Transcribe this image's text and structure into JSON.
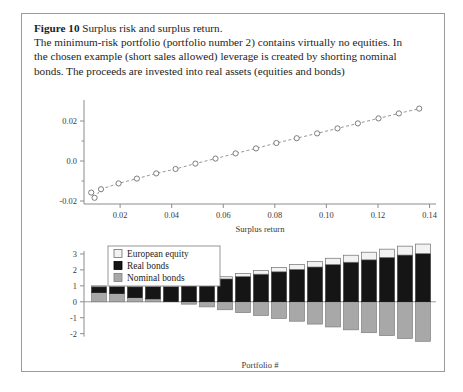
{
  "caption": {
    "figure_label": "Figure 10",
    "title": "Surplus risk and surplus return.",
    "line1": "The minimum-risk portfolio (portfolio number 2) contains virtually no equities. In",
    "line2": "the chosen example (short sales allowed) leverage is created by shorting nominal",
    "line3": "bonds. The proceeds are invested into real assets (equities and bonds)"
  },
  "colors": {
    "frame": "#9a9a9a",
    "axis": "#8c8c8c",
    "text": "#1d1d1d",
    "tick_text": "#3a3a3a",
    "european_equity": "#f2f2f2",
    "real_bonds": "#151515",
    "nominal_bonds": "#a8a8a8",
    "marker_stroke": "#6f6f6f",
    "line": "#8a8a8a"
  },
  "chart_data": [
    {
      "type": "scatter",
      "id": "surplus-frontier",
      "title": "",
      "xlabel": "Surplus return",
      "ylabel": "",
      "xlim": [
        0.006,
        0.1425
      ],
      "ylim": [
        -0.0215,
        0.0285
      ],
      "xticks": [
        0.02,
        0.04,
        0.06,
        0.08,
        0.1,
        0.12,
        0.14
      ],
      "xtick_labels": [
        "0.02",
        "0.04",
        "0.06",
        "0.08",
        "0.10",
        "0.12",
        "0.14"
      ],
      "yticks": [
        -0.02,
        0.0,
        0.02
      ],
      "ytick_labels": [
        "-0.02",
        "0.0",
        "0.02"
      ],
      "grid": false,
      "legend": "none",
      "marker": "open-circle",
      "connected": true,
      "x": [
        0.0088,
        0.0101,
        0.0126,
        0.0194,
        0.0265,
        0.034,
        0.0415,
        0.0492,
        0.057,
        0.0648,
        0.0727,
        0.0806,
        0.0885,
        0.0964,
        0.1043,
        0.1122,
        0.1202,
        0.1281,
        0.136
      ],
      "y": [
        -0.0158,
        -0.0184,
        -0.0141,
        -0.0112,
        -0.0088,
        -0.0062,
        -0.004,
        -0.0013,
        0.0012,
        0.0038,
        0.0063,
        0.009,
        0.0114,
        0.0138,
        0.0163,
        0.0188,
        0.0213,
        0.0238,
        0.0262
      ]
    },
    {
      "type": "bar",
      "id": "portfolio-weights",
      "stacked": true,
      "title": "",
      "xlabel": "Portfolio #",
      "ylabel": "",
      "ylim": [
        -2.65,
        3.75
      ],
      "yticks": [
        -2,
        -1,
        0,
        1,
        2,
        3
      ],
      "ytick_labels": [
        "-2",
        "-1",
        "0",
        "1",
        "2",
        "3"
      ],
      "grid": false,
      "legend": "upper-left",
      "categories": [
        "1",
        "2",
        "3",
        "4",
        "5",
        "6",
        "7",
        "8",
        "9",
        "10",
        "11",
        "12",
        "13",
        "14",
        "15",
        "16",
        "17",
        "18",
        "19"
      ],
      "series": [
        {
          "name": "Nominal bonds",
          "color": "#a8a8a8",
          "values": [
            0.58,
            0.52,
            0.26,
            0.18,
            0.02,
            -0.15,
            -0.32,
            -0.5,
            -0.68,
            -0.86,
            -1.04,
            -1.22,
            -1.4,
            -1.58,
            -1.76,
            -1.94,
            -2.12,
            -2.3,
            -2.48
          ]
        },
        {
          "name": "Real bonds",
          "color": "#151515",
          "values": [
            0.36,
            0.44,
            0.68,
            0.78,
            0.93,
            1.12,
            1.27,
            1.43,
            1.58,
            1.73,
            1.88,
            2.03,
            2.18,
            2.33,
            2.48,
            2.63,
            2.78,
            2.93,
            3.02
          ]
        },
        {
          "name": "European equity",
          "color": "#f2f2f2",
          "values": [
            0.06,
            0.04,
            0.06,
            0.04,
            0.05,
            0.07,
            0.1,
            0.14,
            0.19,
            0.23,
            0.27,
            0.31,
            0.35,
            0.4,
            0.44,
            0.48,
            0.52,
            0.56,
            0.6
          ]
        }
      ],
      "legend_entries": [
        "European equity",
        "Real bonds",
        "Nominal bonds"
      ]
    }
  ]
}
